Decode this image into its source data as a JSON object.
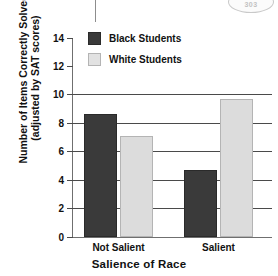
{
  "corner_badge": {
    "text": "303"
  },
  "chart_data": {
    "type": "bar",
    "title": "",
    "xlabel": "Salience of Race",
    "ylabel": "Number of Items Correctly Solved (adjusted by SAT scores)",
    "ylabel_line1": "Number of Items Correctly Solved",
    "ylabel_line2": "(adjusted by SAT scores)",
    "categories": [
      "Not Salient",
      "Salient"
    ],
    "series": [
      {
        "name": "Black Students",
        "color": "#3a3a3a",
        "values": [
          8.6,
          4.7
        ]
      },
      {
        "name": "White Students",
        "color": "#dcdcdc",
        "values": [
          7.1,
          9.7
        ]
      }
    ],
    "ylim": [
      0,
      14
    ],
    "ytick_values": [
      0,
      2,
      4,
      6,
      8,
      10,
      12,
      14
    ],
    "ytick_labels": [
      "0",
      "2",
      "4",
      "6",
      "8",
      "10",
      "12",
      "14"
    ],
    "gridlines_at": [
      2,
      4,
      6,
      8,
      10
    ],
    "grid": true,
    "legend_position": "upper-left-inside"
  }
}
